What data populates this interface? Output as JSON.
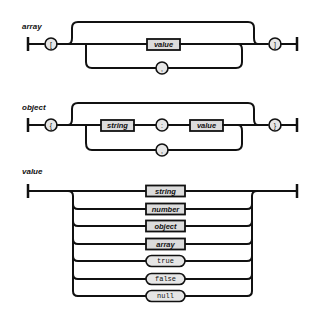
{
  "diagrams": {
    "array": {
      "label": "array",
      "open": "[",
      "close": "]",
      "item": "value",
      "separator": ","
    },
    "object": {
      "label": "object",
      "open": "{",
      "close": "}",
      "key": "string",
      "colon": ":",
      "item": "value",
      "separator": ","
    },
    "value": {
      "label": "value",
      "options": [
        {
          "text": "string",
          "kind": "nonterminal"
        },
        {
          "text": "number",
          "kind": "nonterminal"
        },
        {
          "text": "object",
          "kind": "nonterminal"
        },
        {
          "text": "array",
          "kind": "nonterminal"
        },
        {
          "text": "true",
          "kind": "terminal"
        },
        {
          "text": "false",
          "kind": "terminal"
        },
        {
          "text": "null",
          "kind": "terminal"
        }
      ]
    }
  },
  "colors": {
    "stroke": "#111111",
    "nonterminal_fill": "#dcdcdc",
    "terminal_fill": "#e6e6e6",
    "background": "#ffffff"
  }
}
